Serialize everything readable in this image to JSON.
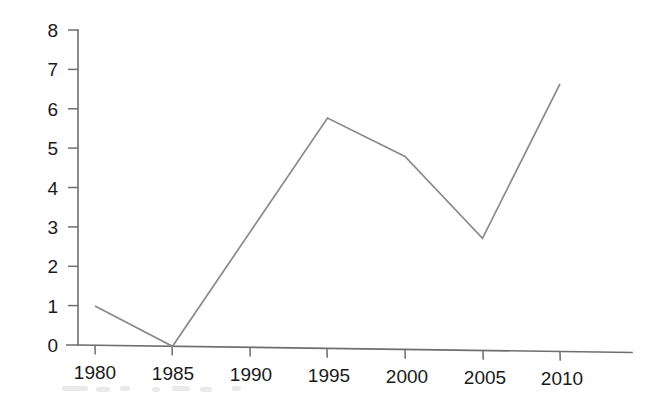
{
  "chart_data": {
    "type": "line",
    "title": "",
    "subtitle": "",
    "xlabel": "",
    "ylabel": "",
    "x": [
      1980,
      1985,
      1990,
      1995,
      2000,
      2005,
      2010
    ],
    "categories": [
      "1980",
      "1985",
      "1990",
      "1995",
      "2000",
      "2005",
      "2010"
    ],
    "values": [
      1.0,
      0.0,
      2.95,
      5.85,
      4.9,
      2.85,
      6.8
    ],
    "series": [
      {
        "name": "",
        "values": [
          1.0,
          0.0,
          2.95,
          5.85,
          4.9,
          2.85,
          6.8
        ]
      }
    ],
    "vertices": [
      {
        "x": 1980,
        "y": 1.0
      },
      {
        "x": 1985,
        "y": 0.0
      },
      {
        "x": 1995,
        "y": 5.85
      },
      {
        "x": 2000,
        "y": 4.9
      },
      {
        "x": 2005,
        "y": 2.85
      },
      {
        "x": 2010,
        "y": 6.8
      }
    ],
    "xlim": [
      1980,
      2010
    ],
    "ylim": [
      0,
      8
    ],
    "y_ticks": [
      0,
      1,
      2,
      3,
      4,
      5,
      6,
      7,
      8
    ],
    "y_tick_labels": [
      "0",
      "1",
      "2",
      "3",
      "4",
      "5",
      "6",
      "7",
      "8"
    ],
    "x_ticks": [
      1980,
      1985,
      1990,
      1995,
      2000,
      2005,
      2010
    ],
    "x_tick_labels": [
      "1980",
      "1985",
      "1990",
      "1995",
      "2000",
      "2005",
      "2010"
    ],
    "grid": false,
    "legend": false,
    "legend_position": "none",
    "markers": false,
    "annotations": [],
    "line_color": "#8a8a8a",
    "axis_color": "#6e6e6e",
    "text_color": "#1a1a1a",
    "background_color": "#ffffff"
  },
  "axes": {
    "y_axis_name": "y-axis",
    "x_axis_name": "x-axis"
  }
}
